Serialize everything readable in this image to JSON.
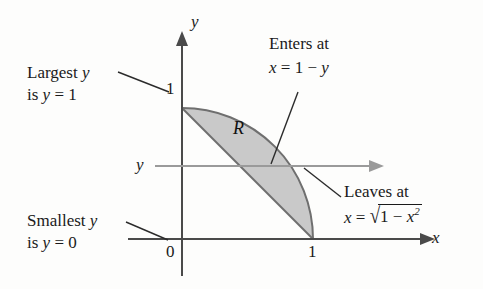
{
  "figure": {
    "type": "calculus-region-diagram",
    "background_color": "#fdfdfc",
    "region_fill": "#c9c9c9",
    "axis_color": "#4a4a4a",
    "slice_color": "#9a9a9a",
    "curve_color": "#6f6f6f",
    "text_color": "#1a1a1a"
  },
  "axes": {
    "x_axis_label": "x",
    "y_axis_label": "y",
    "origin_tick": "0",
    "x_tick_one": "1",
    "y_tick_one": "1"
  },
  "region": {
    "label": "R",
    "description": "Region bounded on the left by the line x = 1 - y and on the right by the circular arc x = sqrt(1 - y^2), between y = 0 and y = 1."
  },
  "slice": {
    "label": "y",
    "description": "horizontal slice arrow at height y"
  },
  "annotations": {
    "largest": {
      "line1_text": "Largest ",
      "line1_var": "y",
      "line2_prefix": "is ",
      "line2_var": "y",
      "line2_eq": " = 1"
    },
    "smallest": {
      "line1_text": "Smallest ",
      "line1_var": "y",
      "line2_prefix": "is ",
      "line2_var": "y",
      "line2_eq": " = 0"
    },
    "enters": {
      "line1": "Enters at",
      "eq_var": "x",
      "eq_rhs": " = 1 − ",
      "eq_tail": "y"
    },
    "leaves": {
      "line1": "Leaves at",
      "eq_var": "x",
      "eq_eq": " = ",
      "radical_sign": "√",
      "radicand_head": "1 − ",
      "radicand_var": "x",
      "radicand_exp": "2"
    }
  },
  "geometry": {
    "origin_px": [
      182,
      239
    ],
    "unit_px": 131,
    "y_axis_top_px": 40,
    "x_axis_right_px": 428,
    "slice_y_px": 166,
    "slice_left_px": 155,
    "slice_right_px": 377
  }
}
